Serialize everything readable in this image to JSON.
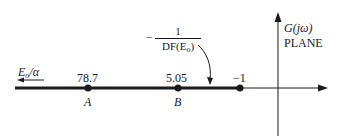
{
  "diagram": {
    "plane_label": {
      "line1": "G(jω)",
      "line2": "PLANE"
    },
    "left_arrow_label": {
      "base": "E",
      "sub": "o",
      "rest": "/α"
    },
    "describing_function_label": {
      "prefix": "−",
      "numerator": "1",
      "denominator_base": "DF(E",
      "denominator_sub": "o",
      "denominator_close": ")"
    },
    "points": [
      {
        "value": "78.7",
        "name": "A"
      },
      {
        "value": "5.05",
        "name": "B"
      },
      {
        "value": "−1",
        "name": ""
      }
    ],
    "colors": {
      "ink": "#1a1a1a",
      "background": "#ffffff"
    }
  }
}
